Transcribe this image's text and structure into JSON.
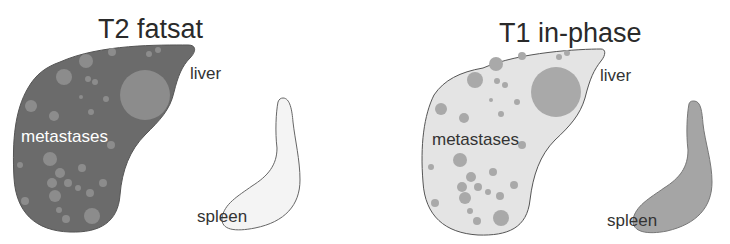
{
  "panels": [
    {
      "title": "T2 fatsat",
      "labels": {
        "liver": "liver",
        "metastases": "metastases",
        "spleen": "spleen"
      },
      "colors": {
        "liver": "#6b6b6b",
        "metastases": "#8c8c8c",
        "spleen": "#f4f4f4",
        "outline": "#555555"
      }
    },
    {
      "title": "T1 in-phase",
      "labels": {
        "liver": "liver",
        "metastases": "metastases",
        "spleen": "spleen"
      },
      "colors": {
        "liver": "#e4e4e4",
        "metastases": "#a9a9a9",
        "spleen": "#a5a5a5",
        "outline": "#555555"
      }
    }
  ]
}
